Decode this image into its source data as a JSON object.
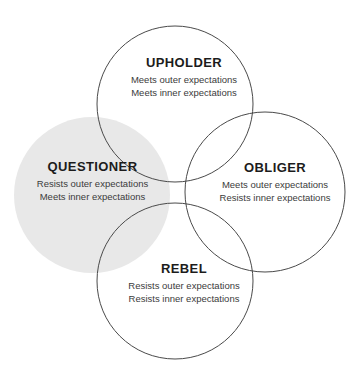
{
  "diagram": {
    "type": "venn",
    "background_color": "#ffffff",
    "outline_color": "#4a4a4a",
    "filled_circle_color": "#e8e8e8",
    "title_text_color": "#1c1c1c",
    "body_text_color": "#3b3b3b",
    "quadrants": [
      {
        "id": "upholder",
        "title": "UPHOLDER",
        "outer_expectation": "Meets outer expectations",
        "inner_expectation": "Meets inner expectations",
        "filled": false
      },
      {
        "id": "questioner",
        "title": "QUESTIONER",
        "outer_expectation": "Resists outer expectations",
        "inner_expectation": "Meets inner expectations",
        "filled": true
      },
      {
        "id": "obliger",
        "title": "OBLIGER",
        "outer_expectation": "Meets outer expectations",
        "inner_expectation": "Resists inner expectations",
        "filled": false
      },
      {
        "id": "rebel",
        "title": "REBEL",
        "outer_expectation": "Resists outer expectations",
        "inner_expectation": "Resists inner expectations",
        "filled": false
      }
    ]
  }
}
